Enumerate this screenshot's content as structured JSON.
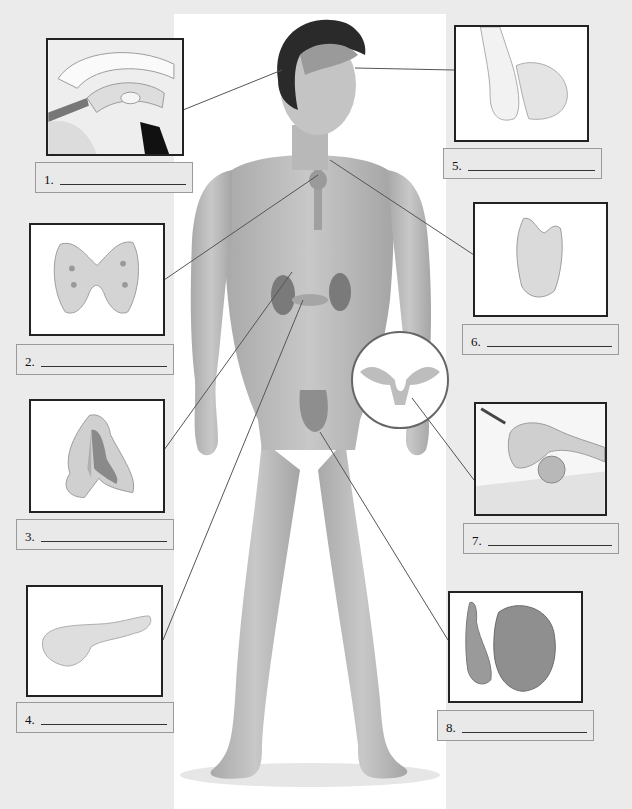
{
  "diagram": {
    "colors": {
      "background": "#ebebeb",
      "panel": "#ffffff",
      "skin": "#bdbdbd",
      "hair": "#2a2a2a",
      "organ": "#8a8a8a",
      "leader_line": "#555555",
      "box_border": "#222222",
      "label_bg": "#e9e9e9"
    },
    "labels": [
      {
        "number": "1.",
        "answer": "",
        "depicts": "hypothalamus-brain-section"
      },
      {
        "number": "2.",
        "answer": "",
        "depicts": "thyroid-gland"
      },
      {
        "number": "3.",
        "answer": "",
        "depicts": "adrenal-gland"
      },
      {
        "number": "4.",
        "answer": "",
        "depicts": "pancreas"
      },
      {
        "number": "5.",
        "answer": "",
        "depicts": "pituitary-gland"
      },
      {
        "number": "6.",
        "answer": "",
        "depicts": "thymus"
      },
      {
        "number": "7.",
        "answer": "",
        "depicts": "ovary"
      },
      {
        "number": "8.",
        "answer": "",
        "depicts": "testis"
      }
    ],
    "inset": {
      "depicts": "female-reproductive-organs"
    }
  }
}
